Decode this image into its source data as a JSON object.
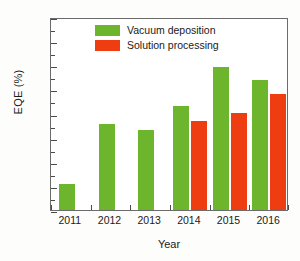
{
  "chart_data": {
    "type": "bar",
    "title": "",
    "xlabel": "Year",
    "ylabel": "EQE (%)",
    "categories": [
      "2011",
      "2012",
      "2013",
      "2014",
      "2015",
      "2016"
    ],
    "series": [
      {
        "name": "Vacuum deposition",
        "color": "#6cb52d",
        "values": [
          5.3,
          17.8,
          16.5,
          21.5,
          29.6,
          27.0
        ]
      },
      {
        "name": "Solution processing",
        "color": "#ee3d11",
        "values": [
          null,
          null,
          null,
          18.5,
          20.1,
          24.0
        ]
      }
    ],
    "ylim": [
      0,
      40
    ],
    "yticks": [
      0,
      5,
      10,
      15,
      20,
      25,
      30,
      35,
      40
    ],
    "ytick_labels": [
      "0",
      "5",
      "10",
      "15",
      "20",
      "25",
      "30",
      "35",
      "40"
    ],
    "grid": false,
    "legend_position": "top-center"
  },
  "legend": {
    "items": [
      {
        "label": "Vacuum deposition",
        "color": "#6cb52d"
      },
      {
        "label": "Solution processing",
        "color": "#ee3d11"
      }
    ]
  },
  "axes": {
    "y_title": "EQE (%)",
    "x_title": "Year"
  }
}
